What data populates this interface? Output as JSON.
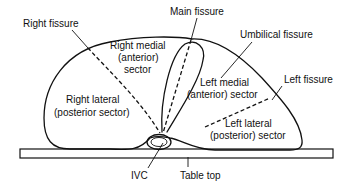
{
  "diagram": {
    "type": "anatomical cross-section",
    "colors": {
      "line": "#111111",
      "background": "#ffffff"
    },
    "labels": {
      "main_fissure": "Main fissure",
      "right_fissure": "Right fissure",
      "umbilical_fissure": "Umbilical fissure",
      "left_fissure": "Left fissure",
      "right_medial_1": "Right medial",
      "right_medial_2": "(anterior)",
      "right_medial_3": "sector",
      "left_medial_1": "Left medial",
      "left_medial_2": "(anterior) sector",
      "right_lateral_1": "Right lateral",
      "right_lateral_2": "(posterior sector)",
      "left_lateral_1": "Left lateral",
      "left_lateral_2": "(posterior) sector",
      "ivc": "IVC",
      "table_top": "Table top"
    }
  }
}
